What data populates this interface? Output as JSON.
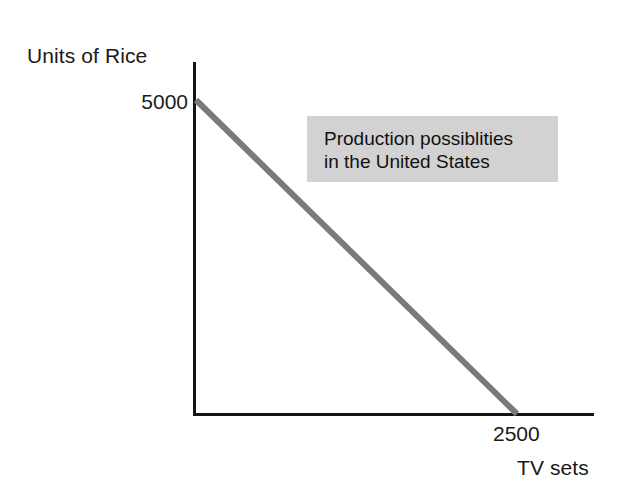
{
  "chart_data": {
    "type": "line",
    "title": "",
    "subtitle": "",
    "xlabel": "TV sets",
    "ylabel": "Units of Rice",
    "xlim": [
      0,
      3115
    ],
    "ylim": [
      0,
      5620
    ],
    "grid": false,
    "legend": "none",
    "x_ticks": [
      2500
    ],
    "x_tick_labels": [
      "2500"
    ],
    "y_ticks": [
      5000
    ],
    "y_tick_labels": [
      "5000"
    ],
    "series": [
      {
        "name": "Production possiblities in the United States",
        "color": "#7a7a7a",
        "line_width": 6,
        "x": [
          0,
          2500
        ],
        "values": [
          5000,
          0
        ]
      }
    ],
    "annotations": [
      {
        "name": "ppf-callout",
        "lines": [
          "Production possiblities",
          "in the United States"
        ],
        "background": "#d2d2d2",
        "text_color": "#111111"
      }
    ]
  },
  "axes": {
    "y_label": "Units of Rice",
    "x_label": "TV sets",
    "y_tick_5000": "5000",
    "x_tick_2500": "2500",
    "axis_color": "#141414"
  },
  "annotation": {
    "line1": "Production possiblities",
    "line2": "in the United States",
    "fill_color": "#d2d2d2"
  },
  "ppf": {
    "color": "#7a7a7a",
    "intercept_rice": "5000",
    "intercept_tv": "2500"
  }
}
